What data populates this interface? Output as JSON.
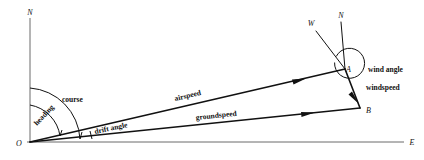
{
  "diagram": {
    "axes": {
      "north_label": "N",
      "east_label": "E",
      "origin_label": "O"
    },
    "points": {
      "origin": "O",
      "air_vector_tip": "A",
      "ground_vector_tip": "B"
    },
    "station_a": {
      "north_label": "N",
      "wind_from_label": "W",
      "point_label": "A"
    },
    "vectors": [
      {
        "name": "airspeed",
        "label": "airspeed",
        "from": "O",
        "to": "A"
      },
      {
        "name": "groundspeed",
        "label": "groundspeed",
        "from": "O",
        "to": "B"
      },
      {
        "name": "windspeed",
        "label": "windspeed",
        "from": "A",
        "to": "B"
      }
    ],
    "angles": [
      {
        "name": "heading",
        "label": "heading"
      },
      {
        "name": "course",
        "label": "course"
      },
      {
        "name": "drift-angle",
        "label": "drift angle"
      },
      {
        "name": "wind-angle",
        "label": "wind angle"
      }
    ],
    "colors": {
      "ink": "#111111",
      "axis": "#6b6b6b",
      "background": "#ffffff"
    }
  }
}
